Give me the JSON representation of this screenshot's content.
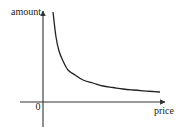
{
  "chart_data": {
    "type": "line",
    "title": "",
    "xlabel": "price",
    "ylabel": "amount",
    "origin_label": "0",
    "xlim": [
      -23,
      122
    ],
    "ylim": [
      -25,
      91
    ],
    "grid": false,
    "legend": "none",
    "series": [
      {
        "name": "demand-curve",
        "description": "inverse (hyperbolic) relationship: amount decreases as price increases",
        "x": [
          10,
          13,
          16,
          20,
          25,
          32,
          40,
          50,
          60,
          70,
          80,
          90,
          100,
          110,
          117
        ],
        "y": [
          90,
          65,
          51,
          41,
          32,
          27,
          22,
          19,
          16,
          14.5,
          13,
          12,
          11.2,
          10.5,
          10
        ]
      }
    ]
  },
  "colors": {
    "axis": "#333333",
    "curve": "#222222",
    "text": "#222222"
  }
}
